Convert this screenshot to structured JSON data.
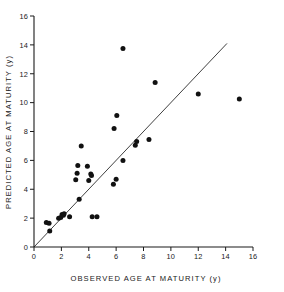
{
  "chart_data": {
    "type": "scatter",
    "title": "",
    "xlabel": "OBSERVED AGE AT MATURITY (y)",
    "ylabel": "PREDICTED AGE AT MATURITY (y)",
    "xlim": [
      0,
      16
    ],
    "ylim": [
      0,
      16
    ],
    "xticks": [
      0,
      2,
      4,
      6,
      8,
      10,
      12,
      14,
      16
    ],
    "yticks": [
      0,
      2,
      4,
      6,
      8,
      10,
      12,
      14,
      16
    ],
    "xtick_labels": [
      "0",
      "2",
      "4",
      "6",
      "8",
      "10",
      "12",
      "14",
      "16"
    ],
    "ytick_labels": [
      "0",
      "2",
      "4",
      "6",
      "8",
      "10",
      "12",
      "14",
      "16"
    ],
    "grid": false,
    "legend": false,
    "marker": "filled-circle",
    "marker_color": "#111111",
    "reference_line": {
      "name": "one-to-one-line",
      "type": "line",
      "description": "1:1 identity line",
      "x": [
        0.0,
        14.1
      ],
      "y": [
        0.0,
        14.1
      ],
      "color": "#2a2a2a"
    },
    "points": [
      {
        "x": 0.9,
        "y": 1.7
      },
      {
        "x": 1.1,
        "y": 1.65
      },
      {
        "x": 1.15,
        "y": 1.1
      },
      {
        "x": 1.8,
        "y": 2.0
      },
      {
        "x": 1.95,
        "y": 2.05
      },
      {
        "x": 2.05,
        "y": 2.25
      },
      {
        "x": 2.15,
        "y": 2.2
      },
      {
        "x": 2.2,
        "y": 2.3
      },
      {
        "x": 2.6,
        "y": 2.1
      },
      {
        "x": 3.05,
        "y": 4.65
      },
      {
        "x": 3.15,
        "y": 5.1
      },
      {
        "x": 3.2,
        "y": 5.65
      },
      {
        "x": 3.3,
        "y": 3.3
      },
      {
        "x": 3.45,
        "y": 7.0
      },
      {
        "x": 3.9,
        "y": 5.6
      },
      {
        "x": 4.0,
        "y": 4.6
      },
      {
        "x": 4.15,
        "y": 5.05
      },
      {
        "x": 4.2,
        "y": 4.95
      },
      {
        "x": 4.25,
        "y": 2.1
      },
      {
        "x": 4.6,
        "y": 2.1
      },
      {
        "x": 5.8,
        "y": 4.35
      },
      {
        "x": 5.85,
        "y": 8.2
      },
      {
        "x": 6.0,
        "y": 4.7
      },
      {
        "x": 6.05,
        "y": 9.1
      },
      {
        "x": 6.5,
        "y": 13.75
      },
      {
        "x": 6.5,
        "y": 6.0
      },
      {
        "x": 7.4,
        "y": 7.05
      },
      {
        "x": 7.5,
        "y": 7.3
      },
      {
        "x": 8.4,
        "y": 7.45
      },
      {
        "x": 8.85,
        "y": 11.4
      },
      {
        "x": 12.0,
        "y": 10.6
      },
      {
        "x": 15.0,
        "y": 10.25
      }
    ]
  }
}
